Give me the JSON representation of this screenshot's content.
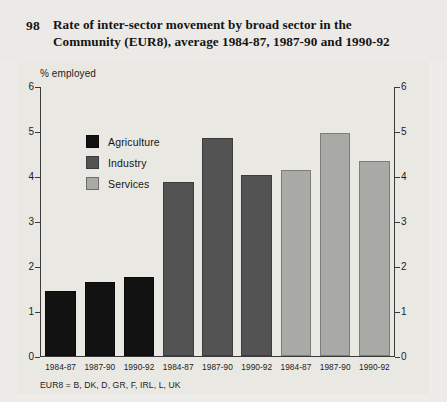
{
  "figure": {
    "number": "98",
    "title_line1": "Rate of inter-sector movement by broad sector in the",
    "title_line2": "Community (EUR8), average 1984-87, 1987-90 and 1990-92"
  },
  "footnote": "EUR8 = B, DK, D, GR, F, IRL, L, UK",
  "colors": {
    "background": "#e9e8e3",
    "agriculture": "#121212",
    "industry": "#535353",
    "services": "#a9a9a6",
    "axis": "#3a3a3a"
  },
  "legend": {
    "items": [
      {
        "label": "Agriculture",
        "key": "agriculture"
      },
      {
        "label": "Industry",
        "key": "industry"
      },
      {
        "label": "Services",
        "key": "services"
      }
    ]
  },
  "chart_data": {
    "type": "bar",
    "title": "Rate of inter-sector movement by broad sector in the Community (EUR8), average 1984-87, 1987-90 and 1990-92",
    "xlabel": "",
    "ylabel": "% employed",
    "ylim": [
      0,
      6
    ],
    "yticks": [
      0,
      1,
      2,
      3,
      4,
      5,
      6
    ],
    "ytick_labels": [
      "0",
      "1",
      "2",
      "3",
      "4",
      "5",
      "6"
    ],
    "grid": false,
    "dual_axis": true,
    "legend_position": "upper-left-inside",
    "categories": [
      "1984-87",
      "1987-90",
      "1990-92"
    ],
    "series": [
      {
        "name": "Agriculture",
        "color": "#121212",
        "values": [
          1.44,
          1.65,
          1.76
        ]
      },
      {
        "name": "Industry",
        "color": "#535353",
        "values": [
          3.86,
          4.84,
          4.02
        ]
      },
      {
        "name": "Services",
        "color": "#a9a9a6",
        "values": [
          4.13,
          4.96,
          4.33
        ]
      }
    ],
    "bars": [
      {
        "group": "Agriculture",
        "category": "1984-87",
        "value": 1.44
      },
      {
        "group": "Agriculture",
        "category": "1987-90",
        "value": 1.65
      },
      {
        "group": "Agriculture",
        "category": "1990-92",
        "value": 1.76
      },
      {
        "group": "Industry",
        "category": "1984-87",
        "value": 3.86
      },
      {
        "group": "Industry",
        "category": "1987-90",
        "value": 4.84
      },
      {
        "group": "Industry",
        "category": "1990-92",
        "value": 4.02
      },
      {
        "group": "Services",
        "category": "1984-87",
        "value": 4.13
      },
      {
        "group": "Services",
        "category": "1987-90",
        "value": 4.96
      },
      {
        "group": "Services",
        "category": "1990-92",
        "value": 4.33
      }
    ],
    "xtick_labels": [
      "1984-87",
      "1987-90",
      "1990-92",
      "1984-87",
      "1987-90",
      "1990-92",
      "1984-87",
      "1987-90",
      "1990-92"
    ]
  }
}
